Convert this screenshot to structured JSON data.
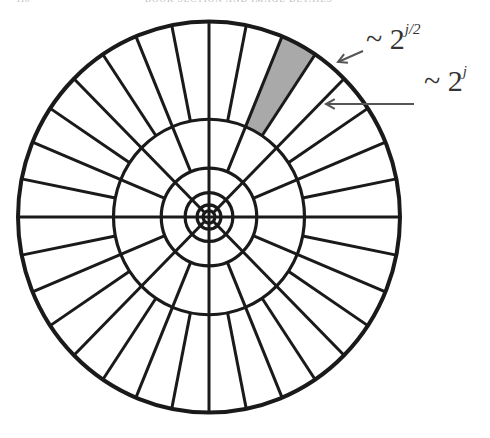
{
  "header": {
    "page_number": "110",
    "running_title": "BOOK SECTION AND IMAGE DETAILS"
  },
  "diagram": {
    "type": "curvelet frequency tiling (polar wedge partition)",
    "center": [
      209,
      217
    ],
    "rings": [
      6,
      12,
      24,
      48,
      96,
      192
    ],
    "outer_ring_sectors": 32,
    "middle_ring_sectors": 16,
    "inner_ring_sectors": 8,
    "highlighted_wedge_color": "#a9a9a9",
    "line_color": "#1a1a1a"
  },
  "annotations": {
    "width_label_base": "~ 2",
    "width_label_exp": "j/2",
    "length_label_base": "~ 2",
    "length_label_exp": "j"
  }
}
